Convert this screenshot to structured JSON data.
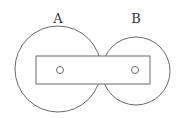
{
  "diagram": {
    "labels": {
      "a": "A",
      "b": "B"
    },
    "colors": {
      "stroke": "#6a6a6a",
      "text": "#333333",
      "background": "#ffffff"
    },
    "shapes": {
      "circle_a": {
        "cx": 58,
        "cy": 69,
        "r": 43
      },
      "circle_b": {
        "cx": 136,
        "cy": 71,
        "r": 34
      },
      "bar": {
        "x": 36,
        "y": 56,
        "width": 114,
        "height": 28
      },
      "hole_a": {
        "cx": 60,
        "cy": 70,
        "r": 3.5
      },
      "hole_b": {
        "cx": 135,
        "cy": 70,
        "r": 3.5
      }
    }
  }
}
